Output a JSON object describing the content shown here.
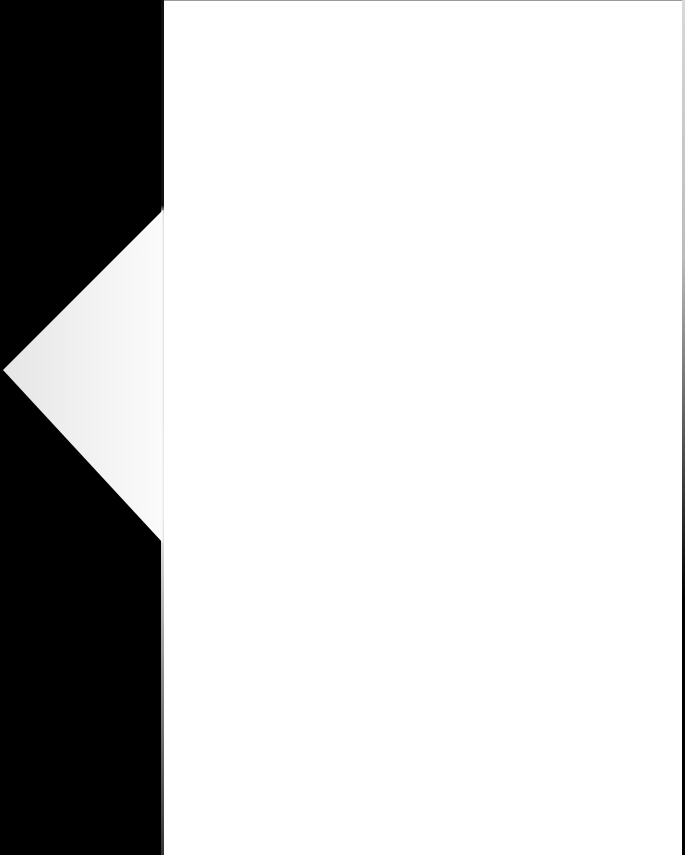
{
  "document": {
    "type": "scanned-page",
    "content_text": "",
    "background_color": "#000000",
    "page_color": "#ffffff",
    "fold_shape": {
      "shape": "triangle",
      "color": "#f4f4f4",
      "points": [
        [
          163,
          210
        ],
        [
          3,
          370
        ],
        [
          163,
          543
        ]
      ]
    }
  }
}
